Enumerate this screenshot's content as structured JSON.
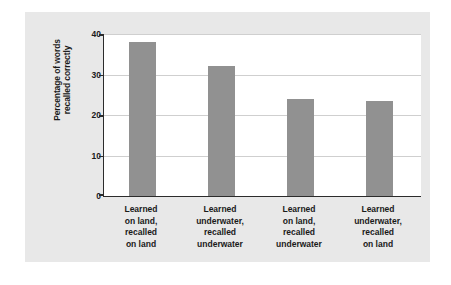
{
  "chart_data": {
    "type": "bar",
    "title": "",
    "xlabel": "",
    "ylabel": "Percentage of words recalled correctly",
    "ylabel_lines": [
      "Percentage of words",
      "recalled correctly"
    ],
    "ylim": [
      0,
      40
    ],
    "yticks": [
      0,
      10,
      20,
      30,
      40
    ],
    "ytick_labels": [
      "0",
      "10",
      "20",
      "30",
      "40"
    ],
    "grid": true,
    "grid_axis": "y",
    "legend": false,
    "categories": [
      "Learned on land, recalled on land",
      "Learned underwater, recalled underwater",
      "Learned on land, recalled underwater",
      "Learned underwater, recalled on land"
    ],
    "category_lines": [
      [
        "Learned",
        "on land,",
        "recalled",
        "on land"
      ],
      [
        "Learned",
        "underwater,",
        "recalled",
        "underwater"
      ],
      [
        "Learned",
        "on land,",
        "recalled",
        "underwater"
      ],
      [
        "Learned",
        "underwater,",
        "recalled",
        "on land"
      ]
    ],
    "values": [
      38,
      32,
      24,
      23.5
    ],
    "bar_color": "#919191",
    "plot_background": "#ffffff",
    "panel_background": "#e8e8e8",
    "axis_color": "#2b2b2b",
    "gridline_color": "#cfcfcf"
  }
}
